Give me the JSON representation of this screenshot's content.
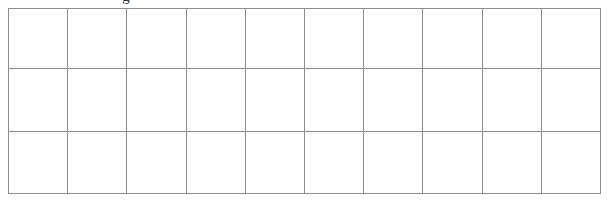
{
  "page": {
    "background_color": "#ffffff",
    "clipped_glyph": {
      "text": "g",
      "description": "partial-character-descender-cut-off-at-top-edge"
    }
  },
  "table": {
    "name": "blank-grid-table",
    "border_color": "#8d8d8d",
    "cell_background": "#ffffff",
    "column_count": 10,
    "row_count": 3,
    "rows": [
      {
        "cells": [
          "",
          "",
          "",
          "",
          "",
          "",
          "",
          "",
          "",
          ""
        ]
      },
      {
        "cells": [
          "",
          "",
          "",
          "",
          "",
          "",
          "",
          "",
          "",
          ""
        ]
      },
      {
        "cells": [
          "",
          "",
          "",
          "",
          "",
          "",
          "",
          "",
          "",
          ""
        ]
      }
    ]
  }
}
